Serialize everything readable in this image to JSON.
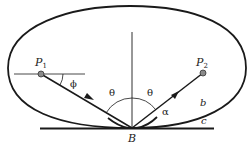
{
  "diagram": {
    "labels": {
      "p1": "P",
      "p1_sub": "1",
      "p2": "P",
      "p2_sub": "2",
      "phi": "ϕ",
      "theta_left": "θ",
      "theta_right": "θ",
      "alpha": "α",
      "b_point": "B",
      "curve_b": "b",
      "line_c": "c"
    },
    "colors": {
      "stroke": "#1a1a1a",
      "point_fill": "#8a8a8a",
      "background": "#ffffff"
    }
  }
}
